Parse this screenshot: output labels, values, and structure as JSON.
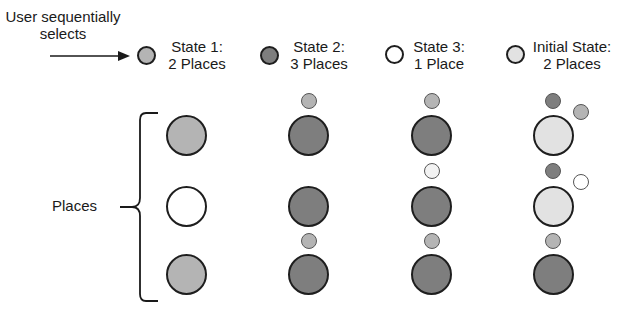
{
  "header": {
    "user_label_line1": "User sequentially",
    "user_label_line2": "selects"
  },
  "legend": [
    {
      "line1": "State 1:",
      "line2": "2 Places",
      "color": "#b4b4b4"
    },
    {
      "line1": "State 2:",
      "line2": "3 Places",
      "color": "#7e7e7e"
    },
    {
      "line1": "State 3:",
      "line2": "1 Place",
      "color": "#ffffff"
    },
    {
      "line1": "Initial State:",
      "line2": "2 Places",
      "color": "#e2e2e2"
    }
  ],
  "places_label": "Places",
  "colors": {
    "state1": "#b4b4b4",
    "state2": "#7e7e7e",
    "state3": "#ffffff",
    "initial": "#e2e2e2"
  },
  "columns": [
    {
      "places": [
        "state1",
        "state3",
        "state1"
      ],
      "markers": []
    },
    {
      "places": [
        "state2",
        "state2",
        "state2"
      ],
      "markers": [
        [
          "state1"
        ],
        [],
        [
          "state1"
        ]
      ]
    },
    {
      "places": [
        "state2",
        "state2",
        "state2"
      ],
      "markers": [
        [
          "state1"
        ],
        [
          "initial_white"
        ],
        [
          "state1"
        ]
      ]
    },
    {
      "places": [
        "initial",
        "initial",
        "state2"
      ],
      "markers": [
        [
          "state2",
          "state1"
        ],
        [
          "state2",
          "state3"
        ],
        [
          "state1"
        ]
      ]
    }
  ]
}
